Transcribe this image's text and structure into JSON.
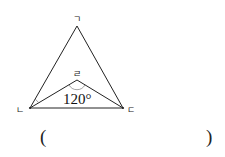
{
  "diagram": {
    "type": "geometry-triangle",
    "vertices": {
      "top": {
        "label": "ㄱ",
        "x": 77,
        "y": 26
      },
      "left": {
        "label": "ㄴ",
        "x": 30,
        "y": 108
      },
      "right": {
        "label": "ㄷ",
        "x": 123,
        "y": 108
      },
      "inner": {
        "label": "ㄹ",
        "x": 77,
        "y": 80
      }
    },
    "angle_label": "120°",
    "line_color": "#222222"
  },
  "answer": {
    "open_paren": "(",
    "close_paren": ")",
    "value": ""
  }
}
